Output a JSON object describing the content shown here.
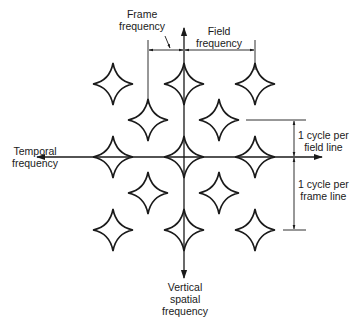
{
  "diagram": {
    "type": "spectrum-lattice",
    "axes": {
      "horizontal": {
        "label_lines": [
          "Temporal",
          "frequency"
        ]
      },
      "vertical": {
        "label_lines": [
          "Vertical",
          "spatial",
          "frequency"
        ]
      }
    },
    "dimensions": {
      "frame_frequency": {
        "label_lines": [
          "Frame",
          "frequency"
        ]
      },
      "field_frequency": {
        "label_lines": [
          "Field",
          "frequency"
        ]
      },
      "cycle_per_field_line": {
        "label_lines": [
          "1 cycle per",
          "field line"
        ]
      },
      "cycle_per_frame_line": {
        "label_lines": [
          "1 cycle per",
          "frame line"
        ]
      }
    },
    "stars": [
      {
        "x": 113,
        "y": 84
      },
      {
        "x": 184,
        "y": 84
      },
      {
        "x": 255,
        "y": 84
      },
      {
        "x": 148,
        "y": 120
      },
      {
        "x": 219,
        "y": 120
      },
      {
        "x": 113,
        "y": 157
      },
      {
        "x": 184,
        "y": 157
      },
      {
        "x": 255,
        "y": 157
      },
      {
        "x": 148,
        "y": 193
      },
      {
        "x": 219,
        "y": 193
      },
      {
        "x": 113,
        "y": 230
      },
      {
        "x": 184,
        "y": 230
      },
      {
        "x": 255,
        "y": 230
      }
    ],
    "stroke_color": "#1a1a1a",
    "background": "#ffffff"
  }
}
